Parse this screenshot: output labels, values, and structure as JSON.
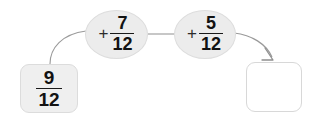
{
  "diagram": {
    "type": "arrow-chain-fraction-addition",
    "background_color": "#ffffff",
    "start": {
      "name": "start-value-box",
      "numerator": "9",
      "denominator": "12",
      "fill_color": "#efefef",
      "border_color": "#dcdcdc"
    },
    "operations": [
      {
        "name": "add-seven-twelfths",
        "sign": "+",
        "numerator": "7",
        "denominator": "12",
        "fill_color": "#ececec",
        "border_color": "#dddddd"
      },
      {
        "name": "add-five-twelfths",
        "sign": "+",
        "numerator": "5",
        "denominator": "12",
        "fill_color": "#ececec",
        "border_color": "#dddddd"
      }
    ],
    "result": {
      "name": "answer-box",
      "value": "",
      "fill_color": "#ffffff",
      "border_color": "#d8d8d8"
    },
    "connectors": {
      "line_color": "#9a9a9a",
      "arrowhead_color": "#8f8f8f"
    }
  }
}
